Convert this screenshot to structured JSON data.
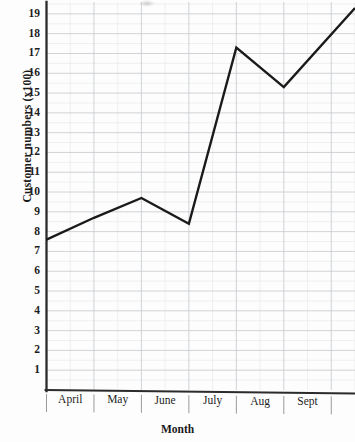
{
  "chart_data": {
    "type": "line",
    "title": "",
    "xlabel": "Month",
    "ylabel": "Customer numbers (x100)",
    "categories": [
      "April",
      "May",
      "June",
      "July",
      "Aug",
      "Sept"
    ],
    "values": [
      7.6,
      8.7,
      9.7,
      8.4,
      17.3,
      15.3
    ],
    "series": [
      {
        "name": "Customer numbers",
        "values": [
          7.6,
          8.7,
          9.7,
          8.4,
          17.3,
          15.3
        ],
        "color": "#1a1a1a"
      }
    ],
    "extra_points": [
      {
        "label": "right-edge",
        "x": 6.5,
        "y": 19.3
      }
    ],
    "ylim": [
      0,
      19.6
    ],
    "xlim": [
      0,
      6.5
    ],
    "yticks": [
      1,
      2,
      3,
      4,
      5,
      6,
      7,
      8,
      9,
      10,
      11,
      12,
      13,
      14,
      15,
      16,
      17,
      18,
      19
    ],
    "ytick_labels": [
      "1",
      "2",
      "3",
      "4",
      "5",
      "6",
      "7",
      "8",
      "9",
      "10",
      "11",
      "12",
      "13",
      "14",
      "15",
      "16",
      "17",
      "18",
      "19"
    ],
    "grid": true,
    "grid_major_color": "#c9cbcf",
    "grid_minor_color": "#e8e9ec",
    "minor_divisions_per_cell": 2,
    "legend": "none",
    "axis_color": "#2b2b2b",
    "line_width": 2.4,
    "markers": "none",
    "background": "#fdfdfd"
  },
  "axes": {
    "y_title": "Customer numbers (x100)",
    "x_title": "Month"
  }
}
